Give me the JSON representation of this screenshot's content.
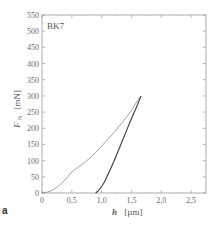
{
  "chart_data": {
    "type": "line",
    "title": "",
    "panel_label": "a",
    "annotation": "BK7",
    "xlabel_symbol": "h",
    "xlabel_unit": "[µm]",
    "ylabel_symbol": "F",
    "ylabel_subscript": "N",
    "ylabel_unit": "[mN]",
    "xlim": [
      0,
      2.75
    ],
    "ylim": [
      0,
      550
    ],
    "xticks": [
      0,
      0.5,
      1.0,
      1.5,
      2.0,
      2.5
    ],
    "xtick_labels": [
      "0",
      "0,5",
      "1,0",
      "1,5",
      "2,0",
      "2,5"
    ],
    "yticks": [
      0,
      50,
      100,
      150,
      200,
      250,
      300,
      350,
      400,
      450,
      500,
      550
    ],
    "ytick_labels": [
      "0",
      "50",
      "100",
      "150",
      "200",
      "250",
      "300",
      "350",
      "400",
      "450",
      "500",
      "550"
    ],
    "grid": false,
    "series": [
      {
        "name": "loading",
        "color": "#8a8a8a",
        "x": [
          0,
          0.1,
          0.2,
          0.3,
          0.4,
          0.5,
          0.6,
          0.7,
          0.8,
          0.9,
          1.0,
          1.1,
          1.2,
          1.3,
          1.4,
          1.5,
          1.6,
          1.66
        ],
        "y": [
          0,
          3,
          11,
          25,
          43,
          65,
          79,
          92,
          108,
          125,
          145,
          165,
          185,
          208,
          230,
          255,
          285,
          300
        ]
      },
      {
        "name": "unloading",
        "color": "#3a3a3a",
        "x": [
          0.9,
          0.95,
          1.0,
          1.05,
          1.1,
          1.2,
          1.3,
          1.4,
          1.5,
          1.6,
          1.66
        ],
        "y": [
          0,
          8,
          20,
          35,
          55,
          95,
          140,
          185,
          230,
          272,
          300
        ]
      }
    ]
  }
}
